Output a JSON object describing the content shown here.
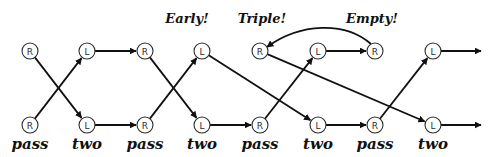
{
  "diagram": {
    "rows": {
      "top_y": 51,
      "bottom_y": 125
    },
    "columns_x": [
      30,
      87,
      145,
      202,
      260,
      318,
      375,
      433
    ],
    "node_radius": 8,
    "top_nodes": [
      "R",
      "L",
      "R",
      "L",
      "R",
      "L",
      "R",
      "L"
    ],
    "bottom_nodes": [
      "R",
      "L",
      "R",
      "L",
      "R",
      "L",
      "R",
      "L"
    ],
    "annotations": [
      {
        "text": "Early!",
        "x": 187,
        "y": 23
      },
      {
        "text": "Triple!",
        "x": 262,
        "y": 23
      },
      {
        "text": "Empty!",
        "x": 372,
        "y": 23
      }
    ],
    "bottom_labels": [
      {
        "text": "pass",
        "x": 30
      },
      {
        "text": "two",
        "x": 87
      },
      {
        "text": "pass",
        "x": 145
      },
      {
        "text": "two",
        "x": 202
      },
      {
        "text": "pass",
        "x": 260
      },
      {
        "text": "two",
        "x": 318
      },
      {
        "text": "pass",
        "x": 375
      },
      {
        "text": "two",
        "x": 433
      }
    ],
    "edges": [
      {
        "from": "top-0",
        "to": "bot-1"
      },
      {
        "from": "bot-0",
        "to": "top-1"
      },
      {
        "from": "top-1",
        "to": "top-2"
      },
      {
        "from": "bot-1",
        "to": "bot-2"
      },
      {
        "from": "top-2",
        "to": "bot-3"
      },
      {
        "from": "bot-2",
        "to": "top-3"
      },
      {
        "from": "top-3",
        "to": "bot-5"
      },
      {
        "from": "bot-3",
        "to": "bot-4"
      },
      {
        "from": "bot-4",
        "to": "top-5"
      },
      {
        "from": "top-4",
        "to": "bot-7"
      },
      {
        "from": "top-5",
        "to": "top-6"
      },
      {
        "from": "top-6",
        "to": "top-4",
        "curved": true
      },
      {
        "from": "bot-5",
        "to": "bot-6"
      },
      {
        "from": "bot-6",
        "to": "top-7"
      },
      {
        "from": "top-7",
        "to": "off-right"
      },
      {
        "from": "bot-7",
        "to": "off-right"
      }
    ],
    "colors": {
      "stroke": "#111111",
      "node_fill": "#ffffff",
      "background": "#ffffff"
    }
  }
}
